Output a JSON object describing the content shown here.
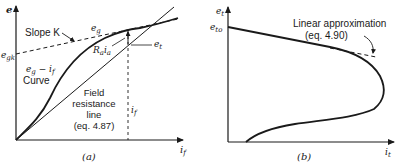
{
  "panel_a": {
    "caption": "(a)",
    "y_axis_label": "e",
    "x_axis_label": "i",
    "x_axis_sub": "f",
    "egk_label": "e",
    "egk_sub": "gk",
    "slope_label": "Slope K",
    "eg_label": "e",
    "eg_sub": "g",
    "et_label": "e",
    "et_sub": "t",
    "raia_label_r": "R",
    "raia_label_r_sub": "a",
    "raia_label_i": "i",
    "raia_label_i_sub": "a",
    "curve_label_line1": "e",
    "curve_label_line1_sub": "g",
    "curve_label_dash": " − i",
    "curve_label_line1_sub2": "f",
    "curve_label_line2": "Curve",
    "field_line_label_1": "Field",
    "field_line_label_2": "resistance",
    "field_line_label_3": "line",
    "field_line_label_4": "(eq. 4.87)",
    "if_marker_label": "i",
    "if_marker_sub": "f"
  },
  "panel_b": {
    "caption": "(b)",
    "y_axis_label": "e",
    "y_axis_sub": "t",
    "x_axis_label": "i",
    "x_axis_sub": "t",
    "eto_label": "e",
    "eto_sub": "to",
    "approx_label_1": "Linear approximation",
    "approx_label_2": "(eq. 4.90)"
  },
  "colors": {
    "ink": "#1a1a1a",
    "background": "#ffffff"
  }
}
